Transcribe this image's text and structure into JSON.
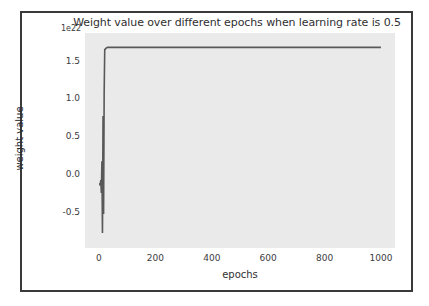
{
  "figure": {
    "background_color": "#ffffff",
    "frame_color": "#3a3a3c",
    "plot_background_color": "#eaeaea",
    "line_color": "#585858"
  },
  "chart_data": {
    "type": "line",
    "title": "Weight value over different epochs when learning rate is 0.5",
    "xlabel": "epochs",
    "ylabel": "weight value",
    "y_offset_label": "1e22",
    "y_scale_exponent": 22,
    "grid": false,
    "legend": null,
    "xlim": [
      -50,
      1050
    ],
    "ylim": [
      -0.85,
      2.0
    ],
    "xticks": [
      0,
      200,
      400,
      600,
      800,
      1000
    ],
    "xtick_labels": [
      "0",
      "200",
      "400",
      "600",
      "800",
      "1000"
    ],
    "yticks": [
      -0.5,
      0.0,
      0.5,
      1.0,
      1.5
    ],
    "ytick_labels": [
      "-0.5",
      "0.0",
      "0.5",
      "1.0",
      "1.5"
    ],
    "series": [
      {
        "name": "weight value",
        "x": [
          0,
          2,
          4,
          6,
          8,
          10,
          12,
          14,
          16,
          18,
          20,
          25,
          30,
          40,
          60,
          100,
          200,
          400,
          600,
          800,
          1000
        ],
        "y": [
          0.0,
          0.0,
          -0.02,
          0.05,
          -0.12,
          0.3,
          -0.65,
          0.9,
          -0.4,
          1.2,
          1.78,
          1.8,
          1.81,
          1.81,
          1.81,
          1.81,
          1.81,
          1.81,
          1.81,
          1.81,
          1.81
        ]
      }
    ]
  }
}
